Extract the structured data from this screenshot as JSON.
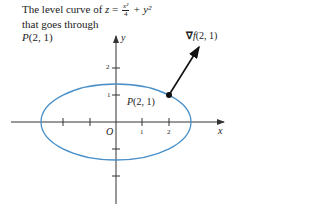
{
  "caption": {
    "line1_prefix": "The level curve of ",
    "z_var": "z",
    "equals": " = ",
    "frac_num": "x²",
    "frac_den": "4",
    "plus_term": " + y²",
    "line2": "that goes through",
    "line3_point": "P",
    "line3_coords": "(2, 1)"
  },
  "axes": {
    "x_label": "x",
    "y_label": "y",
    "origin_label": "O",
    "x_tick_labels": [
      "1",
      "2"
    ],
    "y_tick_labels": [
      "2",
      "1"
    ]
  },
  "point_label": {
    "name": "P",
    "coords": "(2, 1)"
  },
  "gradient_label": {
    "nabla": "∇",
    "func": "f",
    "coords": "(2, 1)"
  },
  "colors": {
    "curve": "#4a90c8",
    "axis": "#333333",
    "arrow": "#111111"
  }
}
